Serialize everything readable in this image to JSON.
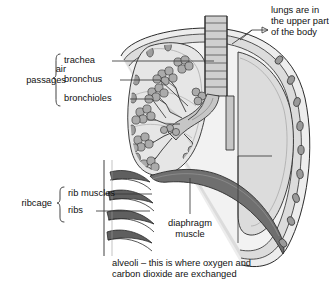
{
  "diagram": {
    "background_color": "#ffffff",
    "ink_color": "#1a1a1a"
  },
  "labels": {
    "air_passages": {
      "group_label": "air\npassages",
      "items": [
        {
          "name": "trachea-label",
          "text": "trachea"
        },
        {
          "name": "bronchus-label",
          "text": "bronchus"
        },
        {
          "name": "bronchioles-label",
          "text": "bronchioles"
        }
      ]
    },
    "ribcage": {
      "group_label": "ribcage",
      "items": [
        {
          "name": "rib-muscles-label",
          "text": "rib muscles"
        },
        {
          "name": "ribs-label",
          "text": "ribs"
        }
      ]
    },
    "position_note": "lungs are in\nthe upper part\nof the body",
    "diaphragm": "diaphragm\nmuscle",
    "alveoli_caption": "alveoli – this is where oxygen and\ncarbon dioxide are exchanged"
  },
  "palette": {
    "lung_fill": "#d8d8d8",
    "lung_fill_light": "#e4e4e4",
    "tissue_mid": "#b8b8b8",
    "tissue_dark": "#8e8e8e",
    "muscle_dark": "#6f6f6f",
    "alveoli_fill": "#a8a8a8",
    "outline": "#2b2b2b",
    "leader": "#3a3a3a"
  }
}
